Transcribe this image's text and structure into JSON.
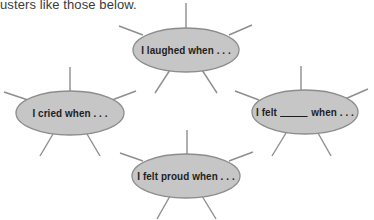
{
  "intro_text": "usters like those below.",
  "colors": {
    "ellipse_fill": "#c6c6c6",
    "ellipse_stroke": "#8c8c8c",
    "spoke": "#8e8e8e",
    "text": "#1e1e1e"
  },
  "clusters": [
    {
      "id": "laughed",
      "label": "I laughed when . . .",
      "center": [
        186,
        50
      ],
      "rx": 53,
      "ry": 22
    },
    {
      "id": "cried",
      "label": "I cried when . . .",
      "center": [
        70,
        113
      ],
      "rx": 54,
      "ry": 22
    },
    {
      "id": "felt-blank",
      "label_prefix": "I felt",
      "label_suffix": "when . . .",
      "center": [
        305,
        112
      ],
      "rx": 53,
      "ry": 22
    },
    {
      "id": "felt-proud",
      "label": "I felt proud when . . .",
      "center": [
        186,
        176
      ],
      "rx": 54,
      "ry": 22
    }
  ]
}
